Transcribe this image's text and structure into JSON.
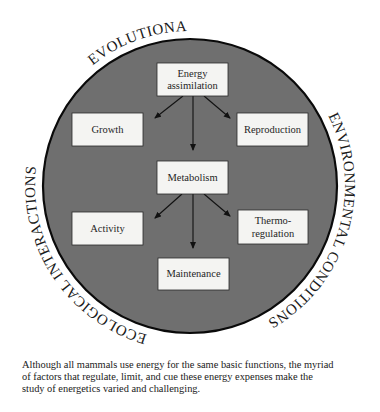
{
  "diagram": {
    "ring_labels": {
      "top": "EVOLUTIONARY PRESSURES",
      "right": "ENVIRONMENTAL CONDITIONS",
      "left": "ECOLOGICAL INTERACTIONS"
    },
    "boxes": {
      "energy_line1": "Energy",
      "energy_line2": "assimilation",
      "growth": "Growth",
      "reproduction": "Reproduction",
      "metabolism": "Metabolism",
      "activity": "Activity",
      "thermo_line1": "Thermo-",
      "thermo_line2": "regulation",
      "maintenance": "Maintenance"
    },
    "colors": {
      "circle_fill": "#6f6f6f",
      "circle_stroke": "#0a0a0a",
      "box_fill": "#f4f4f2"
    }
  },
  "caption": {
    "line1": "Although all mammals use energy for the same basic functions, the myriad",
    "line2": "of factors that regulate, limit, and cue these energy expenses make the",
    "line3": "study of energetics varied and challenging."
  }
}
